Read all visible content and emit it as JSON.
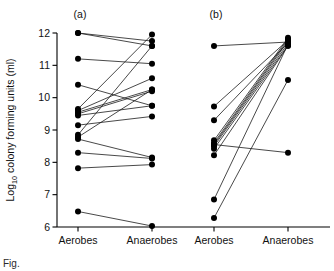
{
  "figure": {
    "panel_a_label": "(a)",
    "panel_b_label": "(b)",
    "caption_fragment": "Fig."
  },
  "chart_data": {
    "type": "line",
    "title": "",
    "subtitle": "",
    "xlabel": "",
    "ylabel": "Log10 colony forming units (ml)",
    "ylabel_base": "Log",
    "ylabel_sub": "10",
    "ylabel_rest": " colony forming units (ml)",
    "ylim": [
      6,
      12
    ],
    "yticks": [
      6,
      7,
      8,
      9,
      10,
      11,
      12
    ],
    "ytick_labels": [
      "6",
      "7",
      "8",
      "9",
      "10",
      "11",
      "12"
    ],
    "grid": false,
    "legend": "none",
    "categories": [
      "Aerobes",
      "Anaerobes"
    ],
    "panels": [
      {
        "name": "a",
        "label": "(a)",
        "x_tick_labels": [
          "Aerobes",
          "Anaerobes"
        ],
        "pairs": [
          {
            "aerobes": 12.0,
            "anaerobes": 11.75
          },
          {
            "aerobes": 12.0,
            "anaerobes": 11.6
          },
          {
            "aerobes": 11.2,
            "anaerobes": 11.05
          },
          {
            "aerobes": 10.4,
            "anaerobes": 9.75
          },
          {
            "aerobes": 9.65,
            "anaerobes": 11.95
          },
          {
            "aerobes": 9.6,
            "anaerobes": 10.6
          },
          {
            "aerobes": 9.55,
            "anaerobes": 10.25
          },
          {
            "aerobes": 9.5,
            "anaerobes": 10.2
          },
          {
            "aerobes": 9.45,
            "anaerobes": 9.75
          },
          {
            "aerobes": 9.15,
            "anaerobes": 9.42
          },
          {
            "aerobes": 8.85,
            "anaerobes": 11.6
          },
          {
            "aerobes": 8.78,
            "anaerobes": 10.25
          },
          {
            "aerobes": 8.72,
            "anaerobes": 8.15
          },
          {
            "aerobes": 8.3,
            "anaerobes": 8.12
          },
          {
            "aerobes": 7.82,
            "anaerobes": 7.93
          },
          {
            "aerobes": 6.48,
            "anaerobes": 6.03
          }
        ]
      },
      {
        "name": "b",
        "label": "(b)",
        "x_tick_labels": [
          "Aerobes",
          "Anaerobes"
        ],
        "pairs": [
          {
            "aerobes": 11.6,
            "anaerobes": 11.72
          },
          {
            "aerobes": 9.73,
            "anaerobes": 11.78
          },
          {
            "aerobes": 9.3,
            "anaerobes": 11.7
          },
          {
            "aerobes": 8.68,
            "anaerobes": 11.85
          },
          {
            "aerobes": 8.6,
            "anaerobes": 11.8
          },
          {
            "aerobes": 8.55,
            "anaerobes": 11.75
          },
          {
            "aerobes": 8.5,
            "anaerobes": 11.68
          },
          {
            "aerobes": 8.42,
            "anaerobes": 11.62
          },
          {
            "aerobes": 8.55,
            "anaerobes": 8.3
          },
          {
            "aerobes": 8.22,
            "anaerobes": 11.6
          },
          {
            "aerobes": 6.85,
            "anaerobes": 11.65
          },
          {
            "aerobes": 6.28,
            "anaerobes": 10.55
          }
        ]
      }
    ]
  }
}
